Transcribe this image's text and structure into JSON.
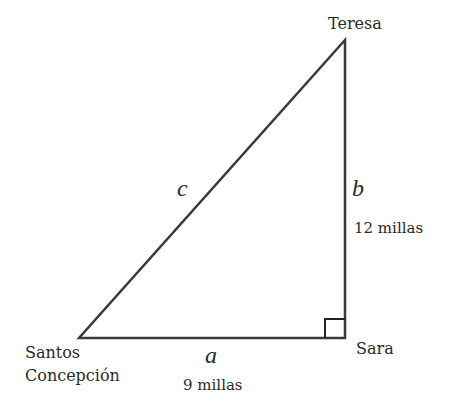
{
  "diagram": {
    "type": "right-triangle",
    "vertices": {
      "top": {
        "label": "Teresa"
      },
      "right_angle": {
        "label": "Sara"
      },
      "left": {
        "label_line1": "Santos",
        "label_line2": "Concepción"
      }
    },
    "sides": {
      "hypotenuse": {
        "variable": "c"
      },
      "vertical": {
        "variable": "b",
        "length": "12 millas"
      },
      "horizontal": {
        "variable": "a",
        "length": "9 millas"
      }
    },
    "colors": {
      "line": "#3a3a3a",
      "text": "#2a2a2a",
      "background": "#ffffff"
    }
  }
}
